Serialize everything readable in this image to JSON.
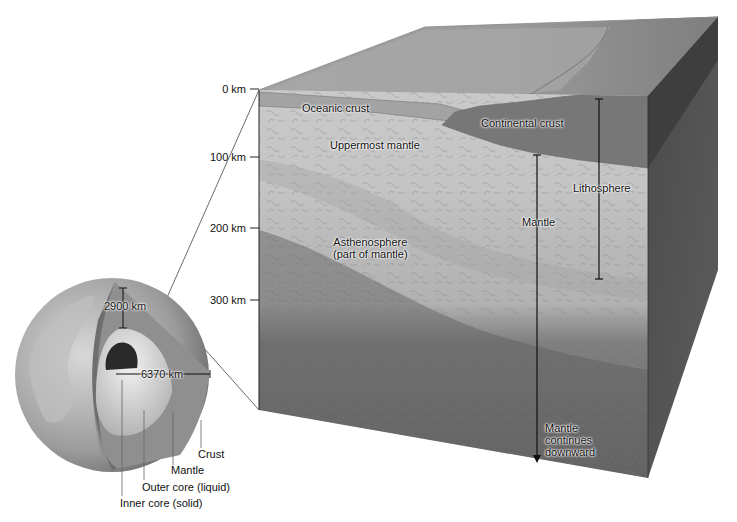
{
  "depth_scale": {
    "ticks": [
      {
        "label": "0 km",
        "y": 89
      },
      {
        "label": "100 km",
        "y": 157
      },
      {
        "label": "200 km",
        "y": 228
      },
      {
        "label": "300 km",
        "y": 300
      }
    ]
  },
  "block_labels": {
    "oceanic_crust": "Oceanic crust",
    "continental_crust": "Continental crust",
    "uppermost_mantle": "Uppermost mantle",
    "asthenosphere_line1": "Asthenosphere",
    "asthenosphere_line2": "(part of mantle)",
    "lithosphere": "Lithosphere",
    "mantle": "Mantle",
    "mantle_continues_line1": "Mantle",
    "mantle_continues_line2": "continues",
    "mantle_continues_line3": "downward"
  },
  "globe_labels": {
    "mantle_depth": "2900 km",
    "earth_radius": "6370 km",
    "crust": "Crust",
    "mantle": "Mantle",
    "outer_core": "Outer core (liquid)",
    "inner_core": "Inner core (solid)"
  },
  "colors": {
    "background": "#ffffff",
    "top_surface": "#9a9a9a",
    "front_light": "#c8c8c8",
    "front_dark": "#6e6e6e",
    "right_face": "#555555",
    "continental_crust": "#777777",
    "text": "#111111"
  }
}
